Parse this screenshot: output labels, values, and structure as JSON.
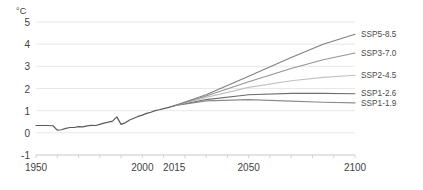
{
  "chart_data": {
    "type": "line",
    "title": "",
    "xlabel": "",
    "ylabel": "°C",
    "unit_label": "°C",
    "xlim": [
      1950,
      2100
    ],
    "ylim": [
      -1,
      5
    ],
    "grid": true,
    "legend_position": "right",
    "x_ticks": [
      {
        "value": 1950,
        "label": "1950"
      },
      {
        "value": 2000,
        "label": "2000"
      },
      {
        "value": 2015,
        "label": "2015"
      },
      {
        "value": 2050,
        "label": "2050"
      },
      {
        "value": 2100,
        "label": "2100"
      }
    ],
    "y_ticks": [
      {
        "value": 5,
        "label": "5"
      },
      {
        "value": 4,
        "label": "4"
      },
      {
        "value": 3,
        "label": "3"
      },
      {
        "value": 2,
        "label": "2"
      },
      {
        "value": 1,
        "label": "1"
      },
      {
        "value": 0,
        "label": "0"
      },
      {
        "value": -1,
        "label": "-1"
      }
    ],
    "historical": {
      "name": "Historical",
      "color": "#5a5a5a",
      "x": [
        1950,
        1955,
        1958,
        1960,
        1962,
        1964,
        1966,
        1968,
        1970,
        1972,
        1974,
        1976,
        1978,
        1980,
        1982,
        1984,
        1986,
        1988,
        1990,
        1992,
        1994,
        1996,
        1998,
        2000,
        2002,
        2004,
        2006,
        2008,
        2010,
        2012,
        2015
      ],
      "y": [
        0.33,
        0.33,
        0.32,
        0.12,
        0.14,
        0.2,
        0.24,
        0.24,
        0.28,
        0.27,
        0.31,
        0.34,
        0.33,
        0.38,
        0.44,
        0.48,
        0.53,
        0.72,
        0.38,
        0.45,
        0.58,
        0.66,
        0.74,
        0.8,
        0.88,
        0.93,
        1.0,
        1.04,
        1.09,
        1.14,
        1.22
      ]
    },
    "series": [
      {
        "name": "SSP5-8.5",
        "label": "SSP5-8.5",
        "color": "#808080",
        "x": [
          2015,
          2030,
          2050,
          2070,
          2085,
          2100
        ],
        "y": [
          1.22,
          1.72,
          2.55,
          3.4,
          4.0,
          4.45
        ],
        "label_y": 4.45
      },
      {
        "name": "SSP3-7.0",
        "label": "SSP3-7.0",
        "color": "#949494",
        "x": [
          2015,
          2030,
          2050,
          2070,
          2085,
          2100
        ],
        "y": [
          1.22,
          1.66,
          2.3,
          2.9,
          3.3,
          3.6
        ],
        "label_y": 3.6
      },
      {
        "name": "SSP2-4.5",
        "label": "SSP2-4.5",
        "color": "#c2c2c2",
        "x": [
          2015,
          2030,
          2050,
          2070,
          2085,
          2100
        ],
        "y": [
          1.22,
          1.6,
          2.05,
          2.35,
          2.5,
          2.6
        ],
        "label_y": 2.6
      },
      {
        "name": "SSP1-2.6",
        "label": "SSP1-2.6",
        "color": "#6e6e6e",
        "x": [
          2015,
          2030,
          2050,
          2070,
          2085,
          2100
        ],
        "y": [
          1.22,
          1.5,
          1.72,
          1.78,
          1.78,
          1.76
        ],
        "label_y": 1.78
      },
      {
        "name": "SSP1-1.9",
        "label": "SSP1-1.9",
        "color": "#8c8c8c",
        "x": [
          2015,
          2030,
          2050,
          2070,
          2085,
          2100
        ],
        "y": [
          1.22,
          1.44,
          1.5,
          1.43,
          1.38,
          1.35
        ],
        "label_y": 1.35
      }
    ],
    "colors": {
      "grid": "#e8e8e8",
      "axis": "#d2d2d2",
      "text": "#3f3f3f",
      "legend_text": "#4a4a4a",
      "background": "#ffffff"
    }
  }
}
